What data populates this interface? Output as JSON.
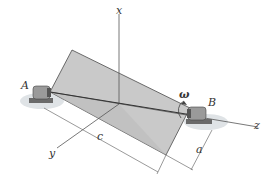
{
  "figure": {
    "axes": {
      "x": "x",
      "y": "y",
      "z": "z"
    },
    "supports": {
      "left": "A",
      "right": "B"
    },
    "angular_velocity": "ω",
    "dimensions": {
      "length": "c",
      "width": "a"
    },
    "colors": {
      "plate": "#c8c8c8",
      "plate_edge": "#555555",
      "bearing": "#8a8a8a",
      "shadow": "#d9dde0",
      "line": "#555555"
    }
  }
}
